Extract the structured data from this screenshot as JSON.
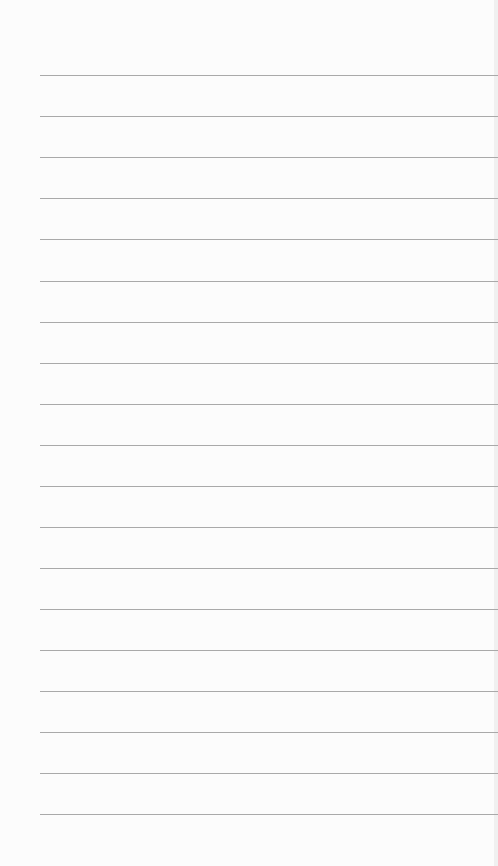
{
  "page": {
    "type": "lined-paper",
    "background_color": "#fcfcfc",
    "line_color": "#a9a9a9",
    "line_left_margin": 40,
    "line_y_positions": [
      75,
      116,
      157,
      198,
      239,
      281,
      322,
      363,
      404,
      445,
      486,
      527,
      568,
      609,
      650,
      691,
      732,
      773,
      814
    ]
  }
}
